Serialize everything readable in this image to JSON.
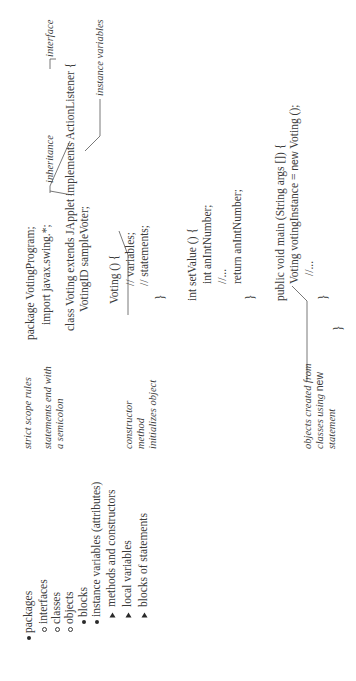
{
  "outline": {
    "items": [
      {
        "marker": "dot",
        "label": "packages",
        "level": 0
      },
      {
        "marker": "circle",
        "label": "interfaces",
        "level": 1
      },
      {
        "marker": "circle",
        "label": "classes",
        "level": 1
      },
      {
        "marker": "circle",
        "label": "objects",
        "level": 1
      },
      {
        "marker": "dot",
        "label": "blocks",
        "level": 2
      },
      {
        "marker": "dot",
        "label": "instance variables (attributes)",
        "level": 2
      },
      {
        "marker": "triangle",
        "label": "methods and constructors",
        "level": 3
      },
      {
        "marker": "triangle",
        "label": "local variables",
        "level": 3
      },
      {
        "marker": "triangle",
        "label": "blocks of statements",
        "level": 3
      }
    ]
  },
  "annotations": {
    "rules": [
      "strict scope rules",
      "statements end with",
      "a semicolon"
    ],
    "constructor": [
      "constructor",
      "method",
      "initializes object"
    ],
    "objects": {
      "line1": "objects created from",
      "line2_prefix": "classes using ",
      "line2_keyword": "new",
      "line3": "statement"
    },
    "inheritance": "inheritance",
    "interface": "interface",
    "instance_variables": "instance variables"
  },
  "code": {
    "lines": [
      "package VotingProgram;",
      "import javax.swing.*;",
      "class Voting extends JApplet implements ActionListener {",
      "VotingID sampleVoter;",
      "Voting () {",
      "// variables;",
      "// statements;",
      "}",
      "int setValue () {",
      "int anIntNumber;",
      "//...",
      "return anIntNumber;",
      "}",
      "public void main (String args []) {",
      "Voting votingInstance = ",
      "new",
      " Voting ();",
      "//...",
      "}",
      "}"
    ]
  }
}
